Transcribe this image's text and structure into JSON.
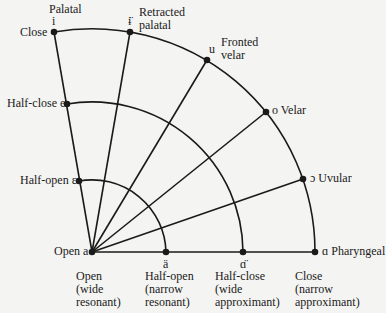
{
  "origin": {
    "label": "Open a",
    "x": 92,
    "y": 252
  },
  "outer_points": [
    {
      "id": "palatal",
      "symbol": "i",
      "label": "Close",
      "top_label": "Palatal",
      "x": 54,
      "y": 32
    },
    {
      "id": "retracted-palatal",
      "symbol": "ɨ̈",
      "label": "Retracted\npalatal",
      "x": 130,
      "y": 32
    },
    {
      "id": "fronted-velar",
      "symbol": "u",
      "label": "Fronted\nvelar",
      "x": 207,
      "y": 60
    },
    {
      "id": "velar",
      "symbol": "o",
      "label": "Velar",
      "x": 266,
      "y": 112
    },
    {
      "id": "uvular",
      "symbol": "ɔ",
      "label": "Uvular",
      "x": 303,
      "y": 179
    },
    {
      "id": "pharyngeal",
      "symbol": "ɑ",
      "label": "Pharyngeal",
      "x": 315,
      "y": 252
    }
  ],
  "labels": {
    "palatal": "Palatal",
    "close": "Close",
    "close_symbol": "i",
    "retracted_symbol": "ɨ̈",
    "retracted_1": "Retracted",
    "retracted_2": "palatal",
    "fronted_symbol": "u",
    "fronted_1": "Fronted",
    "fronted_2": "velar",
    "velar": "o Velar",
    "uvular": "ɔ Uvular",
    "pharyngeal": "ɑ Pharyngeal",
    "half_close": "Half-close e",
    "half_open": "Half-open ε",
    "open": "Open a",
    "half_open_symbol": "ä",
    "half_close_symbol": "ɑ̈"
  },
  "bottom_labels": [
    {
      "line1": "Open",
      "line2": "(wide",
      "line3": "resonant)"
    },
    {
      "line1": "Half-open",
      "line2": "(narrow",
      "line3": "resonant)"
    },
    {
      "line1": "Half-close",
      "line2": "(wide",
      "line3": "approximant)"
    },
    {
      "line1": "Close",
      "line2": "(narrow",
      "line3": "approximant)"
    }
  ],
  "arcs": {
    "r_half_open": 74,
    "r_half_close": 151,
    "r_close": 223
  }
}
